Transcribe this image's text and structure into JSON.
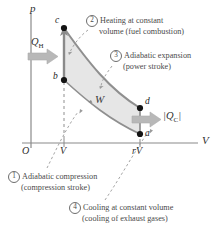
{
  "diagram": {
    "title_type": "otto-cycle-pv-diagram",
    "axes": {
      "y_label": "p",
      "x_label": "V",
      "origin_label": "O",
      "x_ticks": [
        {
          "label": "V",
          "x": 64
        },
        {
          "label": "rV",
          "x": 140
        }
      ]
    },
    "points": [
      {
        "label": "a",
        "x": 140,
        "y": 134
      },
      {
        "label": "b",
        "x": 64,
        "y": 80
      },
      {
        "label": "c",
        "x": 64,
        "y": 28
      },
      {
        "label": "d",
        "x": 140,
        "y": 108
      }
    ],
    "heat_in": {
      "label": "Q",
      "sub": "H"
    },
    "heat_out": {
      "label": "|Q",
      "sub": "C",
      "label_end": "|"
    },
    "work": {
      "label": "W"
    },
    "callouts": [
      {
        "number": "1",
        "line1": "Adiabatic compression",
        "line2": "(compression stroke)"
      },
      {
        "number": "2",
        "line1": "Heating at constant",
        "line2": "volume (fuel combustion)"
      },
      {
        "number": "3",
        "line1": "Adiabatic expansion",
        "line2": "(power stroke)"
      },
      {
        "number": "4",
        "line1": "Cooling at constant volume",
        "line2": "(cooling of exhaust gases)"
      }
    ],
    "colors": {
      "fill": "#e6e6e6",
      "curve": "#8f8f8f",
      "axis": "#7a7a7a",
      "arrow": "#b3b3b3",
      "text": "#3a3a3a",
      "point": "#141414"
    }
  }
}
